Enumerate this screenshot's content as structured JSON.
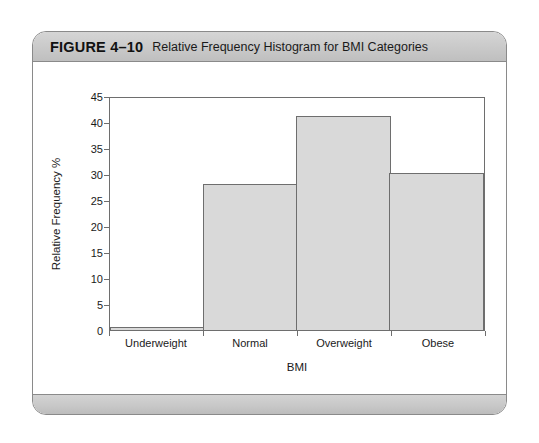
{
  "figure": {
    "number": "FIGURE 4–10",
    "caption": "Relative Frequency Histogram for BMI Categories"
  },
  "chart_data": {
    "type": "bar",
    "title": "Relative Frequency Histogram for BMI Categories",
    "categories": [
      "Underweight",
      "Normal",
      "Overweight",
      "Obese"
    ],
    "values": [
      0.5,
      28,
      41.2,
      30.2
    ],
    "xlabel": "BMI",
    "ylabel": "Relative Frequency %",
    "ylim": [
      0,
      45
    ],
    "ytick_labels": [
      "0",
      "5",
      "10",
      "15",
      "20",
      "25",
      "30",
      "35",
      "40",
      "45"
    ],
    "ytick_values": [
      0,
      5,
      10,
      15,
      20,
      25,
      30,
      35,
      40,
      45
    ],
    "grid": false,
    "legend": false,
    "bar_fill_color": "#d9d9d9",
    "bar_border_color": "#6e6e6e",
    "contiguous_bars": true
  }
}
